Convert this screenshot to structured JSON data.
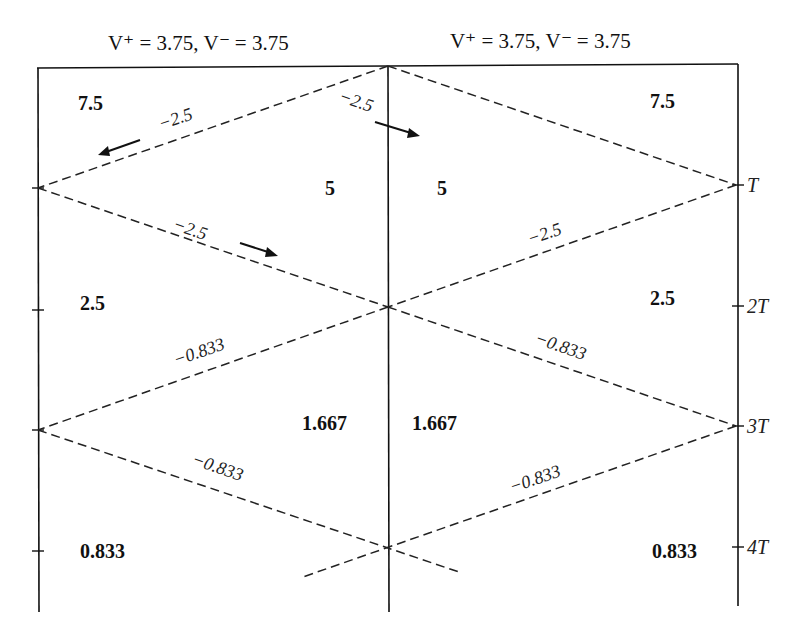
{
  "headers": {
    "left": "V⁺ = 3.75, V⁻ = 3.75",
    "right": "V⁺ = 3.75, V⁻ = 3.75"
  },
  "time_labels": [
    "T",
    "2T",
    "3T",
    "4T"
  ],
  "region_values": {
    "left": [
      "7.5",
      "5",
      "2.5",
      "1.667",
      "0.833"
    ],
    "right": [
      "7.5",
      "5",
      "2.5",
      "1.667",
      "0.833"
    ]
  },
  "wave_labels": {
    "upper_left_top": "−2.5",
    "upper_right_top": "−2.5",
    "upper_left_bottom": "−2.5",
    "upper_right_bottom": "−2.5",
    "lower_left_top": "−0.833",
    "lower_right_top": "−0.833",
    "lower_left_bottom": "−0.833",
    "lower_right_bottom": "−0.833"
  }
}
